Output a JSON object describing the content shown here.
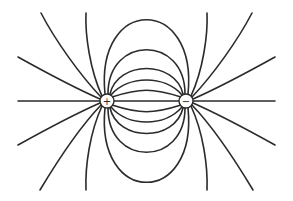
{
  "diagram": {
    "title": "",
    "type": "electric-dipole-field-lines",
    "colors": {
      "line": "#2b2b2b",
      "background": "#ffffff"
    },
    "charges": [
      {
        "id": "positive",
        "sign": "+",
        "cx": 107,
        "cy": 101,
        "r": 7
      },
      {
        "id": "negative",
        "sign": "−",
        "cx": 186,
        "cy": 101,
        "r": 7
      }
    ]
  }
}
